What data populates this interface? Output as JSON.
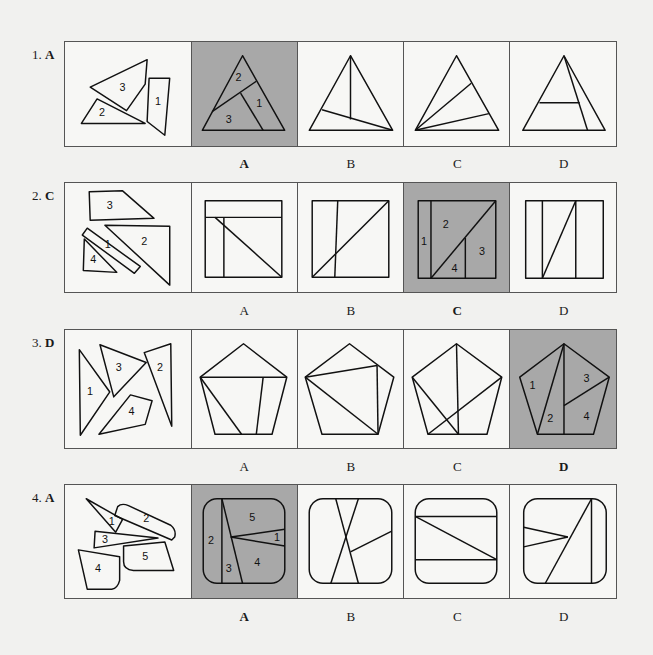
{
  "questions": [
    {
      "number": "1.",
      "answer": "A",
      "pieces_labels": [
        "3",
        "2",
        "1"
      ],
      "options": [
        {
          "label": "A",
          "selected": true,
          "region_labels": [
            "2",
            "1",
            "3"
          ]
        },
        {
          "label": "B",
          "selected": false
        },
        {
          "label": "C",
          "selected": false
        },
        {
          "label": "D",
          "selected": false
        }
      ]
    },
    {
      "number": "2.",
      "answer": "C",
      "pieces_labels": [
        "3",
        "1",
        "2",
        "4"
      ],
      "options": [
        {
          "label": "A",
          "selected": false
        },
        {
          "label": "B",
          "selected": false
        },
        {
          "label": "C",
          "selected": true,
          "region_labels": [
            "2",
            "1",
            "3",
            "4"
          ]
        },
        {
          "label": "D",
          "selected": false
        }
      ]
    },
    {
      "number": "3.",
      "answer": "D",
      "pieces_labels": [
        "1",
        "3",
        "2",
        "4"
      ],
      "options": [
        {
          "label": "A",
          "selected": false
        },
        {
          "label": "B",
          "selected": false
        },
        {
          "label": "C",
          "selected": false
        },
        {
          "label": "D",
          "selected": true,
          "region_labels": [
            "1",
            "3",
            "2",
            "4"
          ]
        }
      ]
    },
    {
      "number": "4.",
      "answer": "A",
      "pieces_labels": [
        "1",
        "2",
        "3",
        "5",
        "4"
      ],
      "options": [
        {
          "label": "A",
          "selected": true,
          "region_labels": [
            "5",
            "2",
            "1",
            "3",
            "4"
          ]
        },
        {
          "label": "B",
          "selected": false
        },
        {
          "label": "C",
          "selected": false
        },
        {
          "label": "D",
          "selected": false
        }
      ]
    }
  ],
  "colors": {
    "page_background": "#f1f1ef",
    "selected_cell": "#a8a8a8",
    "line": "#111111"
  }
}
